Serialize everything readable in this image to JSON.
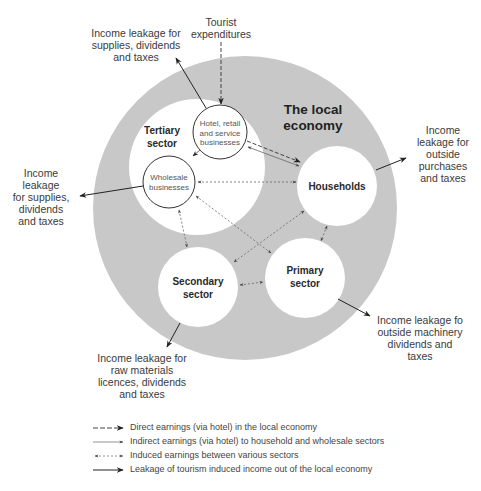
{
  "diagram": {
    "title": [
      "The local",
      "economy"
    ],
    "colors": {
      "local_economy_fill": "#c8c8c8",
      "sector_fill": "#ffffff",
      "stroke": "#333333"
    },
    "inputs": {
      "tourist_expenditures": [
        "Tourist",
        "expenditures"
      ]
    },
    "nodes": {
      "tertiary": [
        "Tertiary",
        "sector"
      ],
      "hotel": [
        "Hotel, retail",
        "and service",
        "businesses"
      ],
      "wholesale": [
        "Wholesale",
        "businesses"
      ],
      "households": "Households",
      "primary": [
        "Primary",
        "sector"
      ],
      "secondary": [
        "Secondary",
        "sector"
      ]
    },
    "leakages": {
      "hotel": [
        "Income leakage for",
        "supplies, dividends",
        "and taxes"
      ],
      "wholesale": [
        "Income",
        "leakage",
        "for supplies,",
        "dividends",
        "and taxes"
      ],
      "households": [
        "Income",
        "leakage for",
        "outside",
        "purchases",
        "and taxes"
      ],
      "primary": [
        "Income leakage fo",
        "outside machinery",
        "dividends and",
        "taxes"
      ],
      "secondary": [
        "Income leakage for",
        "raw materials",
        "licences, dividends",
        "and taxes"
      ]
    },
    "flows": [
      {
        "from": "Tourist expenditures",
        "to": "Hotel, retail and service businesses",
        "type": "direct"
      },
      {
        "from": "Hotel, retail and service businesses",
        "to": "Households",
        "type": "direct"
      },
      {
        "from": "Hotel, retail and service businesses",
        "to": "Households",
        "type": "indirect"
      },
      {
        "from": "Hotel, retail and service businesses",
        "to": "Wholesale businesses",
        "type": "indirect"
      },
      {
        "from": "Wholesale businesses",
        "to": "Households",
        "type": "induced"
      },
      {
        "from": "Wholesale businesses",
        "to": "Secondary sector",
        "type": "induced"
      },
      {
        "from": "Wholesale businesses",
        "to": "Primary sector",
        "type": "induced"
      },
      {
        "from": "Households",
        "to": "Secondary sector",
        "type": "induced"
      },
      {
        "from": "Households",
        "to": "Primary sector",
        "type": "induced"
      },
      {
        "from": "Secondary sector",
        "to": "Primary sector",
        "type": "induced"
      },
      {
        "from": "Hotel, retail and service businesses",
        "to": "outside",
        "type": "leakage"
      },
      {
        "from": "Wholesale businesses",
        "to": "outside",
        "type": "leakage"
      },
      {
        "from": "Households",
        "to": "outside",
        "type": "leakage"
      },
      {
        "from": "Primary sector",
        "to": "outside",
        "type": "leakage"
      },
      {
        "from": "Secondary sector",
        "to": "outside",
        "type": "leakage"
      }
    ]
  },
  "legend": [
    {
      "style": "direct",
      "label": "Direct earnings (via hotel) in the local economy"
    },
    {
      "style": "indirect",
      "label": "Indirect earnings (via hotel) to household and wholesale sectors"
    },
    {
      "style": "induced",
      "label": "Induced earnings between various sectors"
    },
    {
      "style": "leakage",
      "label": "Leakage of tourism induced income out of the local economy"
    }
  ]
}
